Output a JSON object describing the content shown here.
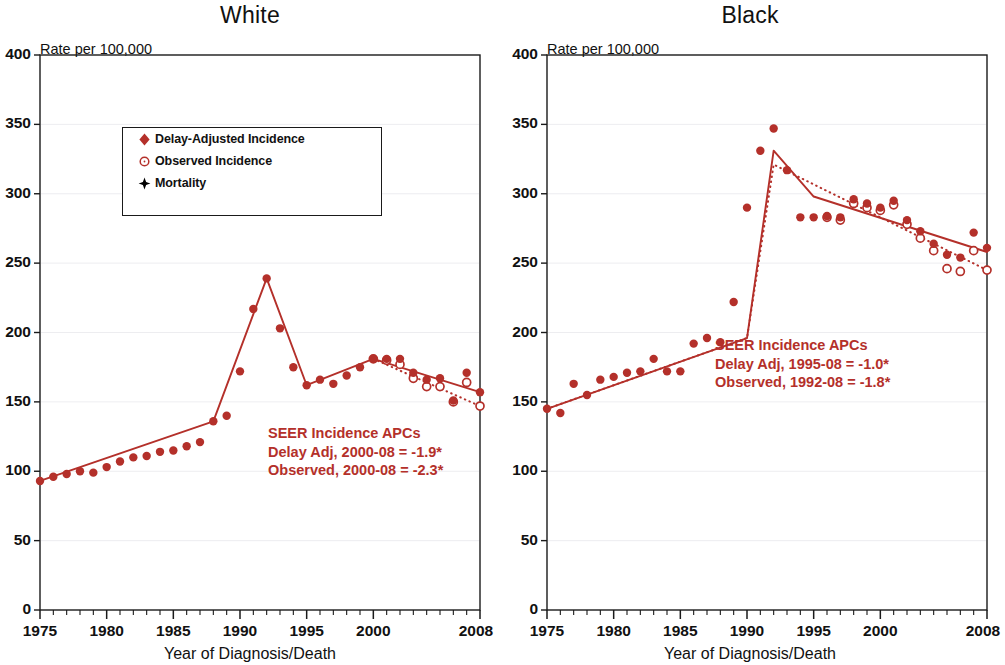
{
  "figure": {
    "x_axis_caption": "Year of Diagnosis/Death",
    "y_axis_caption": "Rate per 100,000",
    "accent_color": "#b4302a",
    "axis_color": "#1a1a1a",
    "legend": {
      "items": [
        {
          "label": "Delay-Adjusted Incidence",
          "symbol": "filled-diamond",
          "color": "#b4302a"
        },
        {
          "label": "Observed Incidence",
          "symbol": "open-circle",
          "color": "#b4302a"
        },
        {
          "label": "Mortality",
          "symbol": "filled-diamond-black",
          "color": "#000000"
        }
      ]
    }
  },
  "panels": [
    {
      "title": "White",
      "annotation": {
        "line1": "SEER Incidence APCs",
        "line2": "Delay Adj, 2000-08 = -1.9*",
        "line3": "Observed, 2000-08 = -2.3*"
      }
    },
    {
      "title": "Black",
      "annotation": {
        "line1": "SEER Incidence APCs",
        "line2": "Delay Adj, 1995-08 = -1.0*",
        "line3": "Observed, 1992-08 = -1.8*"
      }
    }
  ],
  "chart_data": [
    {
      "type": "line",
      "title": "White",
      "xlabel": "Year of Diagnosis/Death",
      "ylabel": "Rate per 100,000",
      "xlim": [
        1975,
        2008
      ],
      "ylim": [
        0,
        400
      ],
      "ytick_labels": [
        "0",
        "50",
        "100",
        "150",
        "200",
        "250",
        "300",
        "350",
        "400"
      ],
      "yticks": [
        0,
        50,
        100,
        150,
        200,
        250,
        300,
        350,
        400
      ],
      "xtick_labels": [
        "1975",
        "1980",
        "1985",
        "1990",
        "1995",
        "2000",
        "2008"
      ],
      "xticks": [
        1975,
        1980,
        1985,
        1990,
        1995,
        2000,
        2008
      ],
      "grid": false,
      "legend_position": "upper-left-inside",
      "series": [
        {
          "name": "Delay-Adjusted Incidence",
          "marker": "filled-diamond",
          "x": [
            1975,
            1976,
            1977,
            1978,
            1979,
            1980,
            1981,
            1982,
            1983,
            1984,
            1985,
            1986,
            1987,
            1988,
            1989,
            1990,
            1991,
            1992,
            1993,
            1994,
            1995,
            1996,
            1997,
            1998,
            1999,
            2000,
            2001,
            2002,
            2003,
            2004,
            2005,
            2006,
            2007,
            2008
          ],
          "values": [
            93,
            96,
            98,
            100,
            99,
            103,
            107,
            110,
            111,
            114,
            115,
            118,
            121,
            136,
            140,
            172,
            217,
            239,
            203,
            175,
            162,
            166,
            163,
            169,
            175,
            181,
            181,
            181,
            171,
            166,
            167,
            151,
            171,
            157
          ]
        },
        {
          "name": "Observed Incidence",
          "marker": "open-circle",
          "x": [
            2000,
            2001,
            2002,
            2003,
            2004,
            2005,
            2006,
            2007,
            2008
          ],
          "values": [
            181,
            180,
            177,
            167,
            161,
            161,
            150,
            164,
            147
          ]
        },
        {
          "name": "Delay-Adjusted Trend",
          "marker": "solid-line",
          "x": [
            1975,
            1988,
            1992,
            1995,
            2000,
            2008
          ],
          "values": [
            93,
            136,
            239,
            162,
            181,
            157
          ]
        },
        {
          "name": "Observed Trend",
          "marker": "dotted-line",
          "x": [
            2000,
            2008
          ],
          "values": [
            181,
            147
          ]
        }
      ]
    },
    {
      "type": "line",
      "title": "Black",
      "xlabel": "Year of Diagnosis/Death",
      "ylabel": "Rate per 100,000",
      "xlim": [
        1975,
        2008
      ],
      "ylim": [
        0,
        400
      ],
      "ytick_labels": [
        "0",
        "50",
        "100",
        "150",
        "200",
        "250",
        "300",
        "350",
        "400"
      ],
      "yticks": [
        0,
        50,
        100,
        150,
        200,
        250,
        300,
        350,
        400
      ],
      "xtick_labels": [
        "1975",
        "1980",
        "1985",
        "1990",
        "1995",
        "2000",
        "2008"
      ],
      "xticks": [
        1975,
        1980,
        1985,
        1990,
        1995,
        2000,
        2008
      ],
      "grid": false,
      "legend_position": "none",
      "series": [
        {
          "name": "Delay-Adjusted Incidence",
          "marker": "filled-diamond",
          "x": [
            1975,
            1976,
            1977,
            1978,
            1979,
            1980,
            1981,
            1982,
            1983,
            1984,
            1985,
            1986,
            1987,
            1988,
            1989,
            1990,
            1991,
            1992,
            1993,
            1994,
            1995,
            1996,
            1997,
            1998,
            1999,
            2000,
            2001,
            2002,
            2003,
            2004,
            2005,
            2006,
            2007,
            2008
          ],
          "values": [
            145,
            142,
            163,
            155,
            166,
            168,
            171,
            172,
            181,
            172,
            172,
            192,
            196,
            193,
            222,
            290,
            331,
            347,
            317,
            283,
            283,
            284,
            283,
            296,
            293,
            290,
            295,
            281,
            273,
            264,
            256,
            254,
            272,
            261
          ]
        },
        {
          "name": "Observed Incidence",
          "marker": "open-circle",
          "x": [
            1996,
            1997,
            1998,
            1999,
            2000,
            2001,
            2002,
            2003,
            2004,
            2005,
            2006,
            2007,
            2008
          ],
          "values": [
            283,
            281,
            293,
            290,
            288,
            292,
            278,
            268,
            259,
            246,
            244,
            259,
            245
          ]
        },
        {
          "name": "Delay-Adjusted Trend",
          "marker": "solid-line",
          "x": [
            1975,
            1990,
            1992,
            1995,
            2008
          ],
          "values": [
            145,
            196,
            331,
            298,
            258
          ]
        },
        {
          "name": "Observed Trend",
          "marker": "dotted-line",
          "x": [
            1975,
            1990,
            1992,
            2008
          ],
          "values": [
            145,
            196,
            321,
            245
          ]
        }
      ]
    }
  ]
}
